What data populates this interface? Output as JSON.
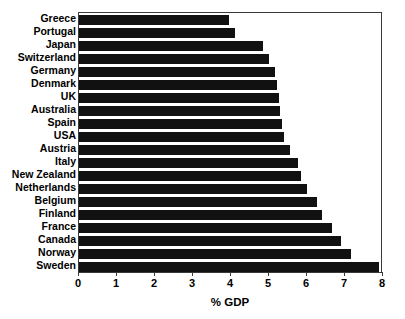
{
  "chart_data": {
    "type": "bar",
    "orientation": "horizontal",
    "title": "",
    "xlabel": "% GDP",
    "ylabel": "",
    "xlim": [
      0,
      8
    ],
    "xticks": [
      0,
      1,
      2,
      3,
      4,
      5,
      6,
      7,
      8
    ],
    "xtick_labels": [
      "0",
      "1",
      "2",
      "3",
      "4",
      "5",
      "6",
      "7",
      "8"
    ],
    "grid": false,
    "legend": null,
    "bar_color": "#111111",
    "background_color": "#ffffff",
    "axis_color": "#3a3a3a",
    "categories": [
      "Greece",
      "Portugal",
      "Japan",
      "Switzerland",
      "Germany",
      "Denmark",
      "UK",
      "Australia",
      "Spain",
      "USA",
      "Austria",
      "Italy",
      "New Zealand",
      "Netherlands",
      "Belgium",
      "Finland",
      "France",
      "Canada",
      "Norway",
      "Sweden"
    ],
    "values": [
      3.95,
      4.1,
      4.85,
      5.0,
      5.15,
      5.2,
      5.25,
      5.3,
      5.35,
      5.4,
      5.55,
      5.75,
      5.85,
      6.0,
      6.25,
      6.4,
      6.65,
      6.9,
      7.15,
      7.9
    ]
  }
}
